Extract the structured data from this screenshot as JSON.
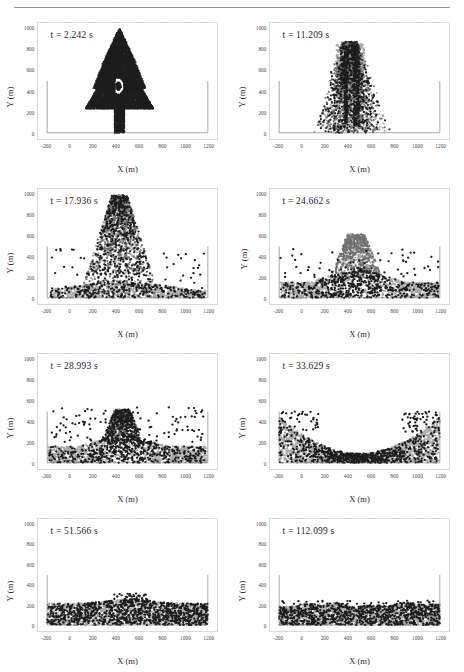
{
  "figure": {
    "type": "multi-panel-scatter",
    "rows": 4,
    "cols": 2
  },
  "axes": {
    "xlabel": "X (m)",
    "ylabel": "Y (m)",
    "xticks": [
      -200,
      0,
      200,
      400,
      600,
      800,
      1000,
      1200
    ],
    "xtick_labels": [
      "-200",
      "0",
      "200",
      "400",
      "600",
      "800",
      "1000",
      "1200"
    ],
    "yticks": [
      0,
      200,
      400,
      600,
      800,
      1000
    ],
    "ytick_labels": [
      "0",
      "200",
      "400",
      "600",
      "800",
      "1000"
    ],
    "xlim": [
      -280,
      1280
    ],
    "ylim": [
      -60,
      1060
    ],
    "grid": false
  },
  "container": {
    "left_wall_x": -200,
    "right_wall_x": 1200,
    "floor_y": 0,
    "wall_top_y": 500,
    "color": "#3a3a3a"
  },
  "colors": {
    "particle_dark": "#1c1c1c",
    "particle_mid": "#6f6f6f",
    "particle_light": "#a9a9a9",
    "frame": "#d8dadd",
    "rule": "#8d9298"
  },
  "panels": [
    {
      "id": "panel-1",
      "time_label": "t = 2.242 s",
      "time_value": 2.242,
      "state": "intact tree shape standing on stem",
      "ylabel_offset": false
    },
    {
      "id": "panel-2",
      "time_label": "t = 11.209 s",
      "time_value": 11.209,
      "state": "tree collapsing, vertical streaks of particles",
      "ylabel_offset": false
    },
    {
      "id": "panel-3",
      "time_label": "t = 17.936 s",
      "time_value": 17.936,
      "state": "broad spreading plume with basal deposit",
      "ylabel_offset": false
    },
    {
      "id": "panel-4",
      "time_label": "t = 24.662 s",
      "time_value": 24.662,
      "state": "central column with wide basal layer",
      "ylabel_offset": true
    },
    {
      "id": "panel-5",
      "time_label": "t = 28.993 s",
      "time_value": 28.993,
      "state": "central mound, thinning plume",
      "ylabel_offset": false
    },
    {
      "id": "panel-6",
      "time_label": "t = 33.629 s",
      "time_value": 33.629,
      "state": "material run-up against both side walls, central depression",
      "ylabel_offset": false
    },
    {
      "id": "panel-7",
      "time_label": "t = 51.566 s",
      "time_value": 51.566,
      "state": "nearly flat deposit, small surface undulations",
      "ylabel_offset": false
    },
    {
      "id": "panel-8",
      "time_label": "t = 112.099 s",
      "time_value": 112.099,
      "state": "settled flat bed at rest",
      "ylabel_offset": false
    }
  ],
  "chart_data": {
    "type": "scatter",
    "title": "",
    "xlabel": "X (m)",
    "ylabel": "Y (m)",
    "xlim": [
      -280,
      1280
    ],
    "ylim": [
      -60,
      1060
    ],
    "grid": false,
    "legend": "none",
    "panel_times_s": [
      2.242,
      11.209,
      17.936,
      24.662,
      28.993,
      33.629,
      51.566,
      112.099
    ],
    "panel_titles": [
      "t = 2.242 s",
      "t = 11.209 s",
      "t = 17.936 s",
      "t = 24.662 s",
      "t = 28.993 s",
      "t = 33.629 s",
      "t = 51.566 s",
      "t = 112.099 s"
    ],
    "series": [
      {
        "name": "t = 2.242 s",
        "n_points": 2600,
        "shape": "tree",
        "x_range": [
          230,
          830
        ],
        "y_range": [
          0,
          1000
        ],
        "notes": "Conifer silhouette with letter-D shaped void near y=450; narrow trunk from y=0 to y=280 centred at x=430"
      },
      {
        "name": "t = 11.209 s",
        "n_points": 2600,
        "shape": "collapsing-plume",
        "x_range": [
          60,
          760
        ],
        "y_range": [
          0,
          900
        ],
        "notes": "Vertical dark streaks near x=380 and x=470; triangular spray envelope"
      },
      {
        "name": "t = 17.936 s",
        "n_points": 2600,
        "shape": "wide-plume",
        "x_range": [
          -150,
          1150
        ],
        "y_range": [
          0,
          1000
        ],
        "notes": "Tall central plume peaking near y=1000 with thin basal deposit across full width"
      },
      {
        "name": "t = 24.662 s",
        "n_points": 2600,
        "shape": "column-and-bed",
        "x_range": [
          -190,
          1190
        ],
        "y_range": [
          0,
          640
        ],
        "notes": "Central column x 300-650 rising to y=600; basal bed about 200 m thick"
      },
      {
        "name": "t = 28.993 s",
        "n_points": 2600,
        "shape": "mound",
        "x_range": [
          -190,
          1190
        ],
        "y_range": [
          0,
          540
        ],
        "notes": "Central mound peaking near y=480; scattered ejecta up to y=550"
      },
      {
        "name": "t = 33.629 s",
        "n_points": 2600,
        "shape": "run-up",
        "x_range": [
          -200,
          1200
        ],
        "y_range": [
          0,
          500
        ],
        "notes": "Material piled against left and right walls to y~420 with central trough near y=120"
      },
      {
        "name": "t = 51.566 s",
        "n_points": 2600,
        "shape": "flat-bed",
        "x_range": [
          -200,
          1200
        ],
        "y_range": [
          0,
          300
        ],
        "notes": "Nearly flat deposit about 220 m deep with slight central bump"
      },
      {
        "name": "t = 112.099 s",
        "n_points": 2600,
        "shape": "flat-bed",
        "x_range": [
          -200,
          1200
        ],
        "y_range": [
          0,
          250
        ],
        "notes": "Final static bed, uniform thickness near 215 m"
      }
    ]
  }
}
